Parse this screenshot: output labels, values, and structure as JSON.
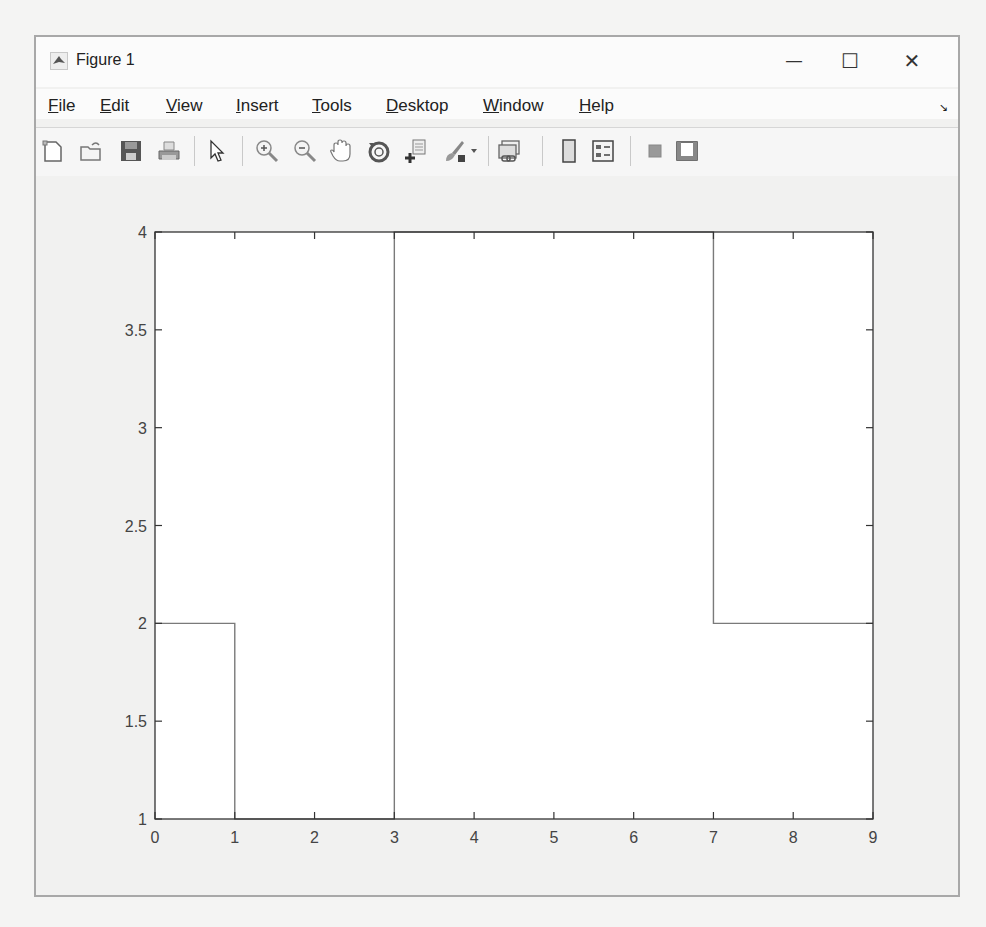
{
  "window": {
    "title": "Figure 1",
    "controls": {
      "minimize": "—",
      "maximize": "☐",
      "close": "✕"
    }
  },
  "menubar": {
    "items": [
      {
        "label": "File",
        "mnemonic": "F",
        "rest": "ile"
      },
      {
        "label": "Edit",
        "mnemonic": "E",
        "rest": "dit"
      },
      {
        "label": "View",
        "mnemonic": "V",
        "rest": "iew"
      },
      {
        "label": "Insert",
        "mnemonic": "I",
        "rest": "nsert"
      },
      {
        "label": "Tools",
        "mnemonic": "T",
        "rest": "ools"
      },
      {
        "label": "Desktop",
        "mnemonic": "D",
        "rest": "esktop"
      },
      {
        "label": "Window",
        "mnemonic": "W",
        "rest": "indow"
      },
      {
        "label": "Help",
        "mnemonic": "H",
        "rest": "elp"
      }
    ],
    "dock_icon": "↘"
  },
  "toolbar": {
    "buttons": [
      "new-figure-icon",
      "open-file-icon",
      "save-icon",
      "print-icon",
      "edit-plot-arrow-icon",
      "zoom-in-icon",
      "zoom-out-icon",
      "pan-hand-icon",
      "rotate-3d-icon",
      "data-cursor-icon",
      "brush-icon",
      "brush-dropdown-icon",
      "link-plot-icon",
      "colorbar-icon",
      "legend-icon",
      "hide-plot-tools-icon",
      "show-plot-tools-icon"
    ]
  },
  "chart_data": {
    "type": "line",
    "subtype": "stairs",
    "title": "",
    "xlabel": "",
    "ylabel": "",
    "xlim": [
      0,
      9
    ],
    "ylim": [
      1,
      4
    ],
    "grid": false,
    "legend": null,
    "xticks": [
      "0",
      "1",
      "2",
      "3",
      "4",
      "5",
      "6",
      "7",
      "8",
      "9"
    ],
    "yticks": [
      "1",
      "1.5",
      "2",
      "2.5",
      "3",
      "3.5",
      "4"
    ],
    "x": [
      0,
      1,
      2,
      3,
      4,
      5,
      6,
      7,
      8,
      9
    ],
    "y": [
      2,
      1,
      1,
      4,
      4,
      4,
      4,
      2,
      2,
      2
    ],
    "step_path": [
      [
        0,
        2
      ],
      [
        1,
        2
      ],
      [
        1,
        1
      ],
      [
        3,
        1
      ],
      [
        3,
        4
      ],
      [
        7,
        4
      ],
      [
        7,
        2
      ],
      [
        9,
        2
      ]
    ],
    "line_color": "#7a7a7a"
  }
}
